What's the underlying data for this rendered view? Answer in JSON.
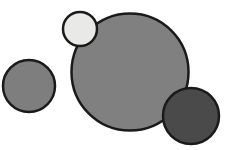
{
  "figure": {
    "background_color": "#ffffff",
    "width": 230,
    "height": 150,
    "outline_color": "#1a1a1a",
    "outline_width": 2.5
  },
  "chart_data": {
    "type": "scatter",
    "subtitle": "",
    "xlabel": "",
    "ylabel": "",
    "xlim": [
      0,
      230
    ],
    "ylim": [
      0,
      150
    ],
    "grid": false,
    "legend": "none",
    "axes_visible": false,
    "background_color": "#ffffff",
    "annotations": [],
    "tick_labels": {
      "x": [],
      "y": []
    },
    "series": [
      {
        "name": "circles",
        "marker": "circle",
        "points": [
          {
            "id": "circle-left-medium",
            "label": "left medium gray circle",
            "cx": 29,
            "cy": 86,
            "r": 26,
            "diameter": 52,
            "fill": "#7e7e7e",
            "stroke": "#1a1a1a",
            "stroke_width": 2.5,
            "z": 1
          },
          {
            "id": "circle-center-large",
            "label": "large center gray circle",
            "cx": 130,
            "cy": 72,
            "r": 58.5,
            "diameter": 117,
            "fill": "#808080",
            "stroke": "#1a1a1a",
            "stroke_width": 2.5,
            "z": 2
          },
          {
            "id": "circle-top-small-light",
            "label": "small light circle top",
            "cx": 80,
            "cy": 29,
            "r": 17,
            "diameter": 34,
            "fill": "#e9e9e7",
            "stroke": "#1a1a1a",
            "stroke_width": 2.5,
            "z": 3
          },
          {
            "id": "circle-bottom-right-dark",
            "label": "dark circle bottom right",
            "cx": 191,
            "cy": 116,
            "r": 28,
            "diameter": 56,
            "fill": "#4a4a4a",
            "stroke": "#1a1a1a",
            "stroke_width": 2.5,
            "z": 4
          }
        ]
      }
    ]
  }
}
